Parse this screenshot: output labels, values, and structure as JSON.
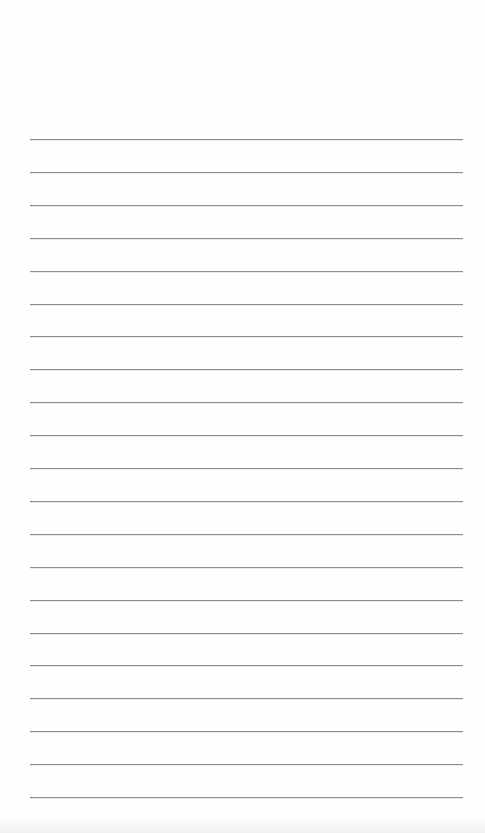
{
  "page": {
    "type": "lined-paper",
    "background_color": "#fefefe",
    "line_color": "#8c8c8c",
    "line_count": 21,
    "first_line_y": 139,
    "line_spacing": 32.9,
    "line_left": 30,
    "line_right": 463,
    "text": []
  }
}
